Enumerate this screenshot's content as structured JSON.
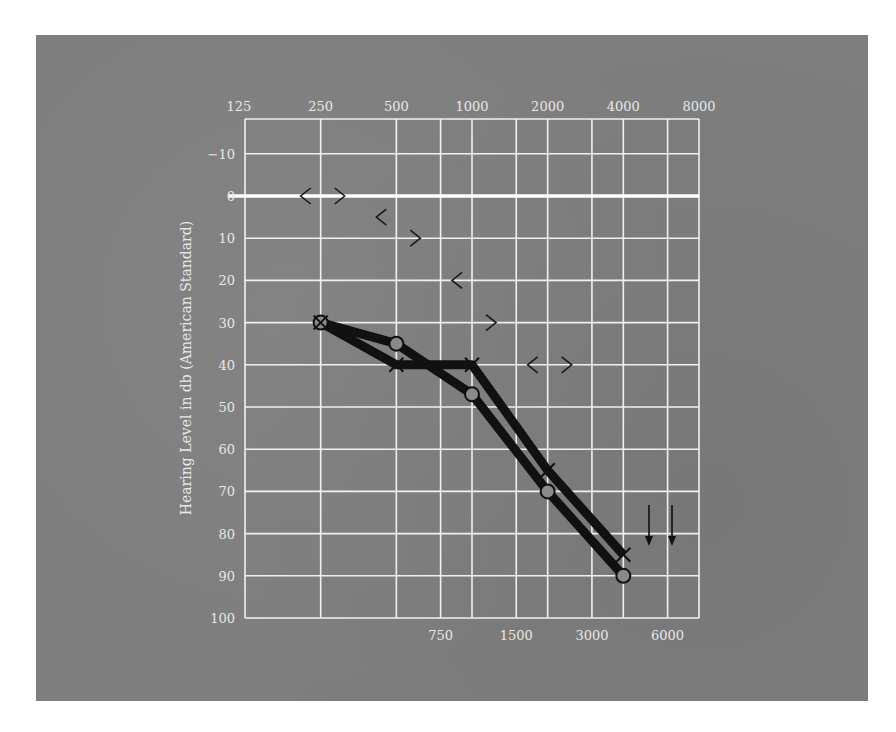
{
  "chart_data": {
    "type": "line",
    "title": "",
    "xlabel": "",
    "ylabel": "Hearing Level in db (American Standard)",
    "x_scale": "log (octave)",
    "x_top_ticks": [
      "125",
      "250",
      "500",
      "1000",
      "2000",
      "4000",
      "8000"
    ],
    "x_bottom_ticks": [
      "750",
      "1500",
      "3000",
      "6000"
    ],
    "y_ticks": [
      "-10",
      "0",
      "10",
      "20",
      "30",
      "40",
      "50",
      "60",
      "70",
      "80",
      "90",
      "100"
    ],
    "ylim": [
      -20,
      100
    ],
    "y_inverted": true,
    "grid": true,
    "reference_line": {
      "y": 0,
      "color": "#ffffff"
    },
    "x": [
      250,
      500,
      1000,
      2000,
      4000
    ],
    "series": [
      {
        "name": "Air conduction (O)",
        "marker": "circle",
        "values": [
          30,
          35,
          47,
          70,
          90
        ]
      },
      {
        "name": "Air conduction (X)",
        "marker": "x",
        "values": [
          30,
          40,
          40,
          65,
          85
        ]
      }
    ],
    "bone_conduction": [
      {
        "name": "Bone conduction (<)",
        "marker": "<",
        "x": [
          250,
          500,
          1000,
          2000
        ],
        "values": [
          0,
          5,
          20,
          40
        ]
      },
      {
        "name": "Bone conduction (>)",
        "marker": ">",
        "x": [
          250,
          500,
          1000,
          2000
        ],
        "values": [
          0,
          10,
          30,
          40
        ]
      }
    ],
    "no_response_arrows": [
      {
        "x": 5000,
        "y": 80
      },
      {
        "x": 6500,
        "y": 80
      }
    ],
    "colors": {
      "background": "#7e7e7e",
      "grid": "#f0f0f0",
      "line": "#111111",
      "text": "#e8e8e8"
    }
  }
}
